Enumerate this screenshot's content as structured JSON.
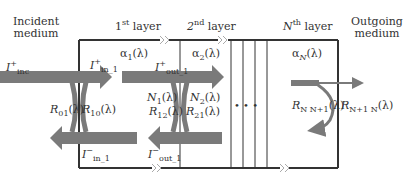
{
  "headers": {
    "incident_medium": [
      "Incident",
      "medium"
    ],
    "layer1": {
      "n": "1",
      "sup": "st",
      "text": "layer"
    },
    "layer2": {
      "n": "2",
      "sup": "nd",
      "text": "layer"
    },
    "layerN": {
      "n": "N",
      "sup": "th",
      "text": "layer"
    },
    "outgoing_medium": [
      "Outgoing",
      "medium"
    ]
  },
  "absorption": {
    "a1": {
      "sym": "α",
      "sub": "1",
      "arg": "(λ)"
    },
    "a2": {
      "sym": "α",
      "sub": "2",
      "arg": "(λ)"
    },
    "aN": {
      "sym": "α",
      "sub": "N",
      "arg": "(λ)"
    }
  },
  "intensities": {
    "inc": {
      "sym": "I",
      "sup": "+",
      "sub": "inc"
    },
    "in1_plus": {
      "sym": "I",
      "sup": "+",
      "sub": "in_1"
    },
    "in1_minus": {
      "sym": "I",
      "sup": "−",
      "sub": "in_1"
    },
    "out1_plus": {
      "sym": "I",
      "sup": "+",
      "sub": "out_1"
    },
    "out1_minus": {
      "sym": "I",
      "sup": "−",
      "sub": "out_1"
    }
  },
  "reflectances": {
    "R01": {
      "sym": "R",
      "sub": "01",
      "arg": "(λ)"
    },
    "R10": {
      "sym": "R",
      "sub": "10",
      "arg": "(λ)"
    },
    "R12": {
      "sym": "R",
      "sub": "12",
      "arg": "(λ)"
    },
    "R21": {
      "sym": "R",
      "sub": "21",
      "arg": "(λ)"
    },
    "RNN1": {
      "sym": "R",
      "sub": "N N+1",
      "arg": "(λ)"
    },
    "RN1N": {
      "sym": "R",
      "sub": "N+1 N",
      "arg": "(λ)"
    }
  },
  "refractive": {
    "N1": {
      "sym": "N",
      "sub": "1",
      "arg": "(λ)"
    },
    "N2": {
      "sym": "N",
      "sub": "2",
      "arg": "(λ)"
    }
  },
  "ellipsis": "• • •",
  "colors": {
    "arrow": "#7a7a7a",
    "line": "#333333",
    "text": "#333333"
  }
}
